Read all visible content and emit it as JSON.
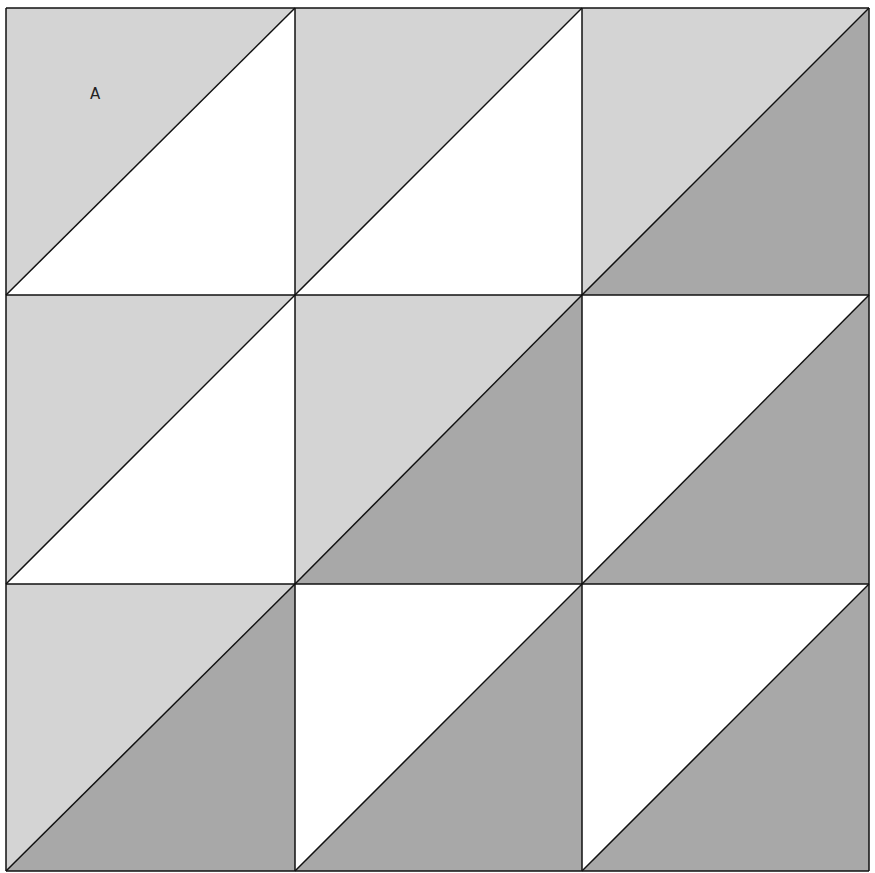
{
  "diagram": {
    "colors": {
      "light": "#d4d4d4",
      "white": "#ffffff",
      "dark": "#a8a8a8",
      "stroke": "#111111"
    },
    "grid": {
      "x": [
        6,
        295,
        582,
        869
      ],
      "y": [
        8,
        295,
        584,
        871
      ]
    },
    "cells": [
      {
        "row": 0,
        "col": 0,
        "upper_left": "light",
        "lower_right": "white"
      },
      {
        "row": 0,
        "col": 1,
        "upper_left": "light",
        "lower_right": "white"
      },
      {
        "row": 0,
        "col": 2,
        "upper_left": "light",
        "lower_right": "dark"
      },
      {
        "row": 1,
        "col": 0,
        "upper_left": "light",
        "lower_right": "white"
      },
      {
        "row": 1,
        "col": 1,
        "upper_left": "light",
        "lower_right": "dark"
      },
      {
        "row": 1,
        "col": 2,
        "upper_left": "white",
        "lower_right": "dark"
      },
      {
        "row": 2,
        "col": 0,
        "upper_left": "light",
        "lower_right": "dark"
      },
      {
        "row": 2,
        "col": 1,
        "upper_left": "white",
        "lower_right": "dark"
      },
      {
        "row": 2,
        "col": 2,
        "upper_left": "white",
        "lower_right": "dark"
      }
    ],
    "labels": [
      {
        "text": "A",
        "x": 90,
        "y": 85
      }
    ]
  }
}
